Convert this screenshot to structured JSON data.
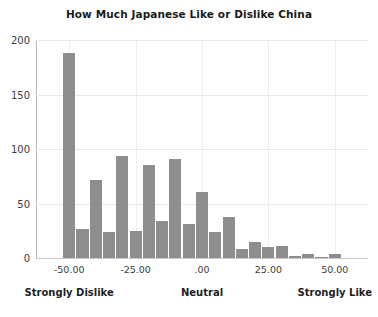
{
  "chart_data": {
    "type": "bar",
    "title": "How Much Japanese Like or Dislike China",
    "xlabel": "",
    "ylabel": "",
    "xlim": [
      -62.5,
      62.5
    ],
    "ylim": [
      0,
      200
    ],
    "grid": true,
    "legend": false,
    "bar_color": "#8e8e8e",
    "grid_color": "#e8e8ec",
    "axis_color": "#b9b9bd",
    "x_tick_labels": [
      "-50.00",
      "-25.00",
      ".00",
      "25.00",
      "50.00"
    ],
    "x_tick_values": [
      -50,
      -25,
      0,
      25,
      50
    ],
    "y_tick_labels": [
      "0",
      "50",
      "100",
      "150",
      "200"
    ],
    "y_tick_values": [
      0,
      50,
      100,
      150,
      200
    ],
    "category_labels": [
      {
        "text": "Strongly Dislike",
        "x": -50
      },
      {
        "text": "Neutral",
        "x": 0
      },
      {
        "text": "Strongly Like",
        "x": 50
      }
    ],
    "bin_width": 5,
    "x": [
      -50,
      -45,
      -40,
      -35,
      -30,
      -25,
      -20,
      -15,
      -10,
      -5,
      0,
      5,
      10,
      15,
      20,
      25,
      30,
      35,
      40,
      45,
      50
    ],
    "categories": [
      "-50",
      "-45",
      "-40",
      "-35",
      "-30",
      "-25",
      "-20",
      "-15",
      "-10",
      "-5",
      "0",
      "5",
      "10",
      "15",
      "20",
      "25",
      "30",
      "35",
      "40",
      "45",
      "50"
    ],
    "values": [
      188,
      27,
      72,
      24,
      94,
      25,
      85,
      34,
      91,
      31,
      61,
      24,
      38,
      8,
      15,
      10,
      11,
      2,
      4,
      1,
      4
    ]
  }
}
